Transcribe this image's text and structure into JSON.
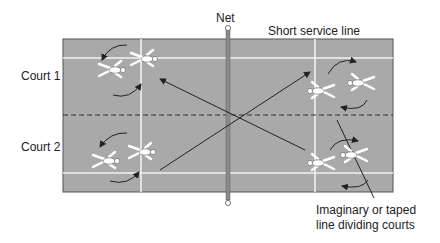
{
  "labels": {
    "net": "Net",
    "short_service_line": "Short service line",
    "court1": "Court 1",
    "court2": "Court 2",
    "divider_line1": "Imaginary or taped",
    "divider_line2": "line dividing courts"
  },
  "colors": {
    "court_fill": "#a9a9a9",
    "court_border": "#555555",
    "lines": "#f2f2f2",
    "net": "#8a8a8a",
    "arrows": "#222222"
  }
}
